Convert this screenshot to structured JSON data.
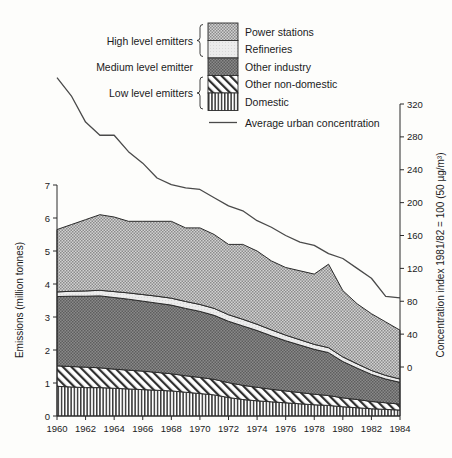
{
  "chart_data": {
    "type": "area",
    "title": "",
    "xlabel": "",
    "ylabel": "Emissions (million tonnes)",
    "y2label": "Concentration index 1981/82 = 100 (50 µg/m³)",
    "xlim": [
      1960,
      1984
    ],
    "ylim": [
      0,
      7
    ],
    "y2lim": [
      0,
      320
    ],
    "grid": false,
    "legend_position": "top-right",
    "x": [
      1960,
      1961,
      1962,
      1963,
      1964,
      1965,
      1966,
      1967,
      1968,
      1969,
      1970,
      1971,
      1972,
      1973,
      1974,
      1975,
      1976,
      1977,
      1978,
      1979,
      1980,
      1981,
      1982,
      1983,
      1984
    ],
    "xticks": [
      1960,
      1962,
      1964,
      1966,
      1968,
      1970,
      1972,
      1974,
      1976,
      1978,
      1980,
      1982,
      1984
    ],
    "xticklabels": [
      "1960",
      "1962",
      "1964",
      "1966",
      "1968",
      "1970",
      "1972",
      "1974",
      "1976",
      "1978",
      "1980",
      "1982",
      "1984"
    ],
    "yticks": [
      0,
      1,
      2,
      3,
      4,
      5,
      6,
      7
    ],
    "yticklabels": [
      "0",
      "1",
      "2",
      "3",
      "4",
      "5",
      "6",
      "7"
    ],
    "y2ticks": [
      0,
      40,
      80,
      120,
      160,
      200,
      240,
      280,
      320
    ],
    "y2ticklabels": [
      "0",
      "40",
      "80",
      "120",
      "160",
      "200",
      "240",
      "280",
      "320"
    ],
    "stacking_order_bottom_to_top": [
      "Domestic",
      "Other non-domestic",
      "Other industry",
      "Refineries",
      "Power stations"
    ],
    "series": [
      {
        "name": "Domestic",
        "pattern": "vertical-lines",
        "values": [
          0.9,
          0.88,
          0.86,
          0.86,
          0.84,
          0.82,
          0.8,
          0.78,
          0.76,
          0.72,
          0.68,
          0.64,
          0.56,
          0.5,
          0.46,
          0.43,
          0.4,
          0.37,
          0.34,
          0.32,
          0.28,
          0.25,
          0.22,
          0.2,
          0.18
        ]
      },
      {
        "name": "Other non-domestic",
        "pattern": "diagonal-hatch",
        "values": [
          0.62,
          0.62,
          0.62,
          0.6,
          0.58,
          0.57,
          0.56,
          0.54,
          0.52,
          0.5,
          0.49,
          0.47,
          0.45,
          0.43,
          0.41,
          0.38,
          0.36,
          0.34,
          0.32,
          0.3,
          0.27,
          0.25,
          0.22,
          0.2,
          0.18
        ]
      },
      {
        "name": "Other industry",
        "pattern": "dark-dots",
        "values": [
          2.1,
          2.13,
          2.15,
          2.18,
          2.17,
          2.15,
          2.12,
          2.1,
          2.08,
          2.04,
          2.0,
          1.94,
          1.86,
          1.8,
          1.72,
          1.62,
          1.52,
          1.44,
          1.36,
          1.3,
          1.1,
          0.95,
          0.82,
          0.72,
          0.66
        ]
      },
      {
        "name": "Refineries",
        "pattern": "light",
        "values": [
          0.14,
          0.15,
          0.16,
          0.17,
          0.18,
          0.19,
          0.2,
          0.21,
          0.21,
          0.21,
          0.21,
          0.21,
          0.2,
          0.2,
          0.19,
          0.18,
          0.17,
          0.16,
          0.15,
          0.15,
          0.14,
          0.13,
          0.12,
          0.11,
          0.1
        ]
      },
      {
        "name": "Power stations",
        "pattern": "medium-dots",
        "values": [
          1.89,
          2.02,
          2.16,
          2.29,
          2.26,
          2.17,
          2.22,
          2.27,
          2.33,
          2.23,
          2.32,
          2.24,
          2.13,
          2.27,
          2.22,
          2.09,
          2.05,
          2.09,
          2.13,
          2.53,
          2.01,
          1.82,
          1.72,
          1.62,
          1.48
        ]
      }
    ],
    "totals": [
      5.65,
      5.8,
      5.95,
      6.1,
      6.03,
      5.9,
      5.9,
      5.9,
      5.9,
      5.7,
      5.7,
      5.5,
      5.2,
      5.2,
      5.0,
      4.7,
      4.5,
      4.4,
      4.3,
      4.6,
      3.8,
      3.4,
      3.1,
      2.85,
      2.6
    ],
    "line_series": {
      "name": "Average urban concentration",
      "unit": "index (1981/82 = 100)",
      "values": [
        352,
        330,
        298,
        282,
        282,
        262,
        248,
        230,
        222,
        218,
        216,
        206,
        196,
        190,
        178,
        170,
        160,
        152,
        148,
        138,
        132,
        120,
        108,
        86,
        84
      ]
    }
  },
  "legend": {
    "items": [
      {
        "label": "Power stations",
        "pattern": "medium-dots"
      },
      {
        "label": "Refineries",
        "pattern": "light"
      },
      {
        "label": "Other industry",
        "pattern": "dark-dots"
      },
      {
        "label": "Other non-domestic",
        "pattern": "diagonal-hatch"
      },
      {
        "label": "Domestic",
        "pattern": "vertical-lines"
      }
    ],
    "line_entry": "Average urban concentration",
    "brackets": [
      {
        "label": "High level emitters"
      },
      {
        "label": "Medium level emitter"
      },
      {
        "label": "Low level emitters"
      }
    ]
  },
  "colors": {
    "ink": "#2b2b2b",
    "power_stations": "#b9b9b9",
    "refineries": "#e4e4e4",
    "other_industry": "#7d7d7d",
    "other_non_domestic": "#ffffff",
    "domestic": "#c9c9c9",
    "line": "#4a4a4a",
    "background": "#fdfdfb"
  }
}
